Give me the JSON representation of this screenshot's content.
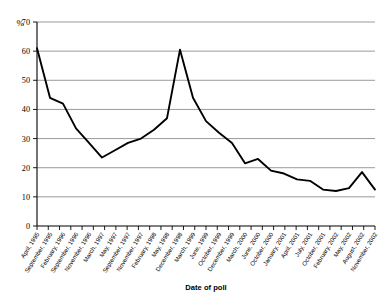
{
  "chart_data": {
    "type": "line",
    "title": "",
    "xlabel": "Date of poll",
    "ylabel": "%",
    "ylim": [
      0,
      70
    ],
    "ytick_step": 10,
    "yticks": [
      0,
      10,
      20,
      30,
      40,
      50,
      60,
      70
    ],
    "grid": true,
    "legend": "none",
    "line_color": "#000000",
    "grid_color": "#808080",
    "axis_color": "#000000",
    "categories": [
      "April, 1995",
      "September, 1995",
      "February, 1996",
      "September, 1996",
      "November, 1996",
      "March, 1997",
      "May, 1997",
      "September, 1997",
      "November, 1997",
      "February, 1998",
      "May, 1998",
      "December, 1998",
      "March, 1999",
      "June, 1999",
      "October, 1999",
      "December, 1999",
      "March, 2000",
      "June, 2000",
      "October, 2000",
      "January, 2001",
      "April, 2001",
      "July, 2001",
      "October, 2001",
      "February, 2002",
      "May, 2002",
      "August, 2002",
      "November, 2002"
    ],
    "values": [
      61,
      44,
      42,
      33.5,
      28.5,
      23.5,
      26,
      28.5,
      30,
      33,
      37,
      60.5,
      44,
      36,
      32,
      28.5,
      21.5,
      23,
      19,
      18,
      16,
      15.5,
      12.5,
      12,
      13,
      18.5,
      12.5
    ],
    "x_tick_count": 31
  },
  "axis": {
    "y_unit_label": "%",
    "x_axis_title": "Date of poll"
  }
}
